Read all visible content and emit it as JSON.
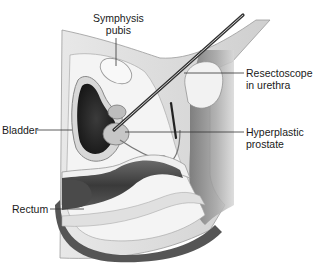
{
  "diagram": {
    "style": "grayscale anatomical illustration",
    "labels": [
      {
        "id": "symphysis",
        "line1": "Symphysis",
        "line2": "pubis"
      },
      {
        "id": "resectoscope",
        "line1": "Resectoscope",
        "line2": "in urethra"
      },
      {
        "id": "bladder",
        "line1": "Bladder",
        "line2": ""
      },
      {
        "id": "prostate",
        "line1": "Hyperplastic",
        "line2": "prostate"
      },
      {
        "id": "rectum",
        "line1": "Rectum",
        "line2": ""
      }
    ],
    "colors": {
      "background": "#ffffff",
      "text": "#1a1a1a",
      "leader_line": "#333333",
      "tissue_dark": "#2a2a2a",
      "tissue_mid": "#8a8a8a",
      "tissue_light": "#d9d9d9"
    }
  }
}
